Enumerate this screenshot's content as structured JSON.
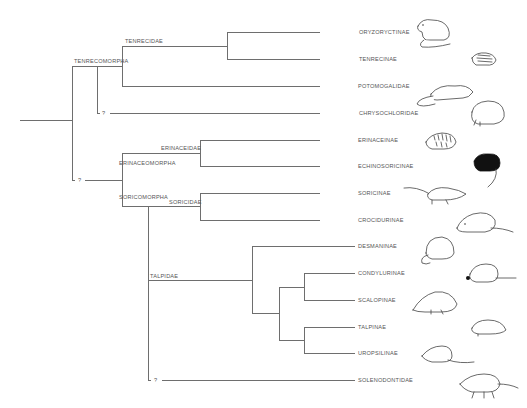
{
  "diagram": {
    "type": "phylogenetic-tree",
    "clades": {
      "tenrecomorpha": "TENRECOMORPHA",
      "tenrecidae": "TENRECIDAE",
      "erinaceidae": "ERINACEIDAE",
      "erinaceomorpha": "ERINACEOMORPHA",
      "soricomorpha": "SORICOMORPHA",
      "soricidae": "SORICIDAE",
      "talpidae": "TALPIDAE"
    },
    "uncertain_marks": [
      "?",
      "?",
      "?"
    ],
    "taxa": [
      {
        "label": "ORYZORYCTINAE",
        "animal": "oryzoryctine-tenrec"
      },
      {
        "label": "TENRECINAE",
        "animal": "streaked-tenrec"
      },
      {
        "label": "POTOMOGALIDAE",
        "animal": "otter-shrew"
      },
      {
        "label": "CHRYSOCHLORIDAE",
        "animal": "golden-mole"
      },
      {
        "label": "ERINACEINAE",
        "animal": "hedgehog"
      },
      {
        "label": "ECHINOSORICINAE",
        "animal": "gymnure"
      },
      {
        "label": "SORICINAE",
        "animal": "red-toothed-shrew"
      },
      {
        "label": "CROCIDURINAE",
        "animal": "white-toothed-shrew"
      },
      {
        "label": "DESMANINAE",
        "animal": "desman"
      },
      {
        "label": "CONDYLURINAE",
        "animal": "star-nosed-mole"
      },
      {
        "label": "SCALOPINAE",
        "animal": "new-world-mole"
      },
      {
        "label": "TALPINAE",
        "animal": "old-world-mole"
      },
      {
        "label": "UROPSILINAE",
        "animal": "shrew-mole"
      },
      {
        "label": "SOLENODONTIDAE",
        "animal": "solenodon"
      }
    ]
  }
}
